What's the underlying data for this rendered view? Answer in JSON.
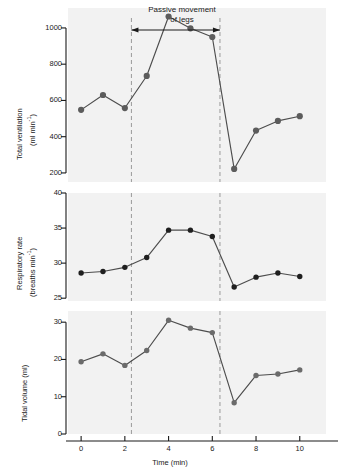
{
  "figure": {
    "annotation": {
      "line1": "Passive movement",
      "line2": "of legs",
      "arrow_start_min": 2.3,
      "arrow_end_min": 6.35
    },
    "event_markers": {
      "start_min": 2.3,
      "end_min": 6.35,
      "style": "dashed",
      "color": "#9a9a9a"
    },
    "xaxis": {
      "label": "Time (min)",
      "ticks": [
        0,
        2,
        4,
        6,
        8,
        10
      ],
      "range": [
        -0.6,
        11.2
      ]
    },
    "colors": {
      "plot_background": "#f2f2f2",
      "marker_panel1": "#5c5c5c",
      "marker_panel2": "#1f1f1f",
      "marker_panel3": "#6b6b6b",
      "line": "#4d4d4d",
      "axis": "#1a1a1a"
    }
  },
  "chart_data": [
    {
      "type": "line",
      "title": "",
      "panel": 1,
      "xlabel": "Time (min)",
      "ylabel": "Total ventilation",
      "ylabel_units": "(ml min",
      "ylabel_exp": "-1",
      "ylabel_units_close": ")",
      "yticks": [
        200,
        400,
        600,
        800,
        1000
      ],
      "ylim": [
        150,
        1110
      ],
      "xlim": [
        -0.6,
        11.2
      ],
      "grid": false,
      "legend": "none",
      "x": [
        0,
        1,
        2,
        3,
        4,
        5,
        6,
        7,
        8,
        9,
        10
      ],
      "values": [
        548,
        630,
        558,
        735,
        1063,
        998,
        950,
        222,
        434,
        487,
        513
      ]
    },
    {
      "type": "line",
      "title": "",
      "panel": 2,
      "xlabel": "Time (min)",
      "ylabel": "Respiratory rate",
      "ylabel_units": "(breaths min",
      "ylabel_exp": "-1",
      "ylabel_units_close": ")",
      "yticks": [
        25,
        30,
        35,
        40
      ],
      "ylim": [
        24.6,
        40
      ],
      "xlim": [
        -0.6,
        11.2
      ],
      "grid": false,
      "legend": "none",
      "x": [
        0,
        1,
        2,
        3,
        4,
        5,
        6,
        7,
        8,
        9,
        10
      ],
      "values": [
        28.6,
        28.8,
        29.4,
        30.8,
        34.7,
        34.7,
        33.8,
        26.6,
        28.0,
        28.6,
        28.1
      ]
    },
    {
      "type": "line",
      "title": "",
      "panel": 3,
      "xlabel": "Time (min)",
      "ylabel": "Tidal volume (ml)",
      "yticks": [
        0,
        10,
        20,
        30
      ],
      "ylim": [
        0,
        33
      ],
      "xlim": [
        -0.6,
        11.2
      ],
      "grid": false,
      "legend": "none",
      "x": [
        0,
        1,
        2,
        3,
        4,
        5,
        6,
        7,
        8,
        9,
        10
      ],
      "values": [
        19.4,
        21.5,
        18.4,
        22.4,
        30.5,
        28.4,
        27.2,
        8.4,
        15.7,
        16.1,
        17.2
      ]
    }
  ]
}
